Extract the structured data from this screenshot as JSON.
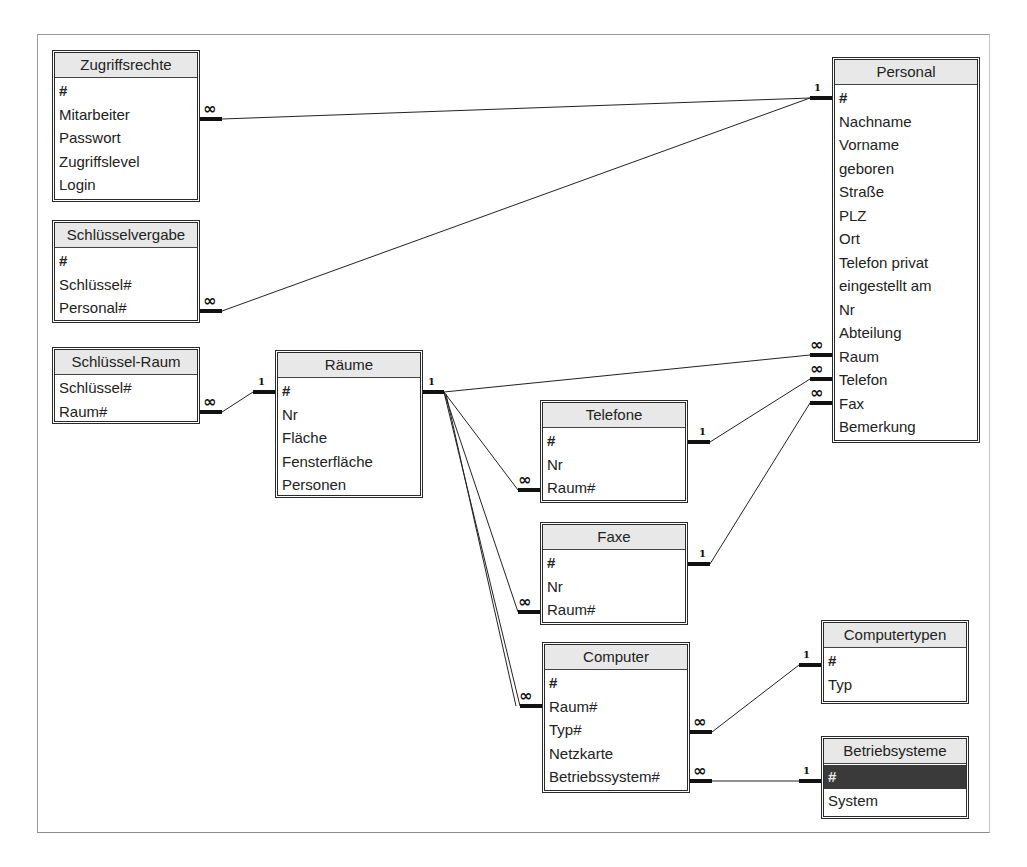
{
  "diagram": {
    "type": "relationships",
    "tables": [
      {
        "id": "zugriffsrechte",
        "name": "Zugriffsrechte",
        "fields": [
          "#",
          "Mitarbeiter",
          "Passwort",
          "Zugriffslevel",
          "Login"
        ]
      },
      {
        "id": "schluesselvergabe",
        "name": "Schlüsselvergabe",
        "fields": [
          "#",
          "Schlüssel#",
          "Personal#"
        ]
      },
      {
        "id": "schluessel_raum",
        "name": "Schlüssel-Raum",
        "fields": [
          "Schlüssel#",
          "Raum#"
        ]
      },
      {
        "id": "raeume",
        "name": "Räume",
        "fields": [
          "#",
          "Nr",
          "Fläche",
          "Fensterfläche",
          "Personen"
        ]
      },
      {
        "id": "personal",
        "name": "Personal",
        "fields": [
          "#",
          "Nachname",
          "Vorname",
          "geboren",
          "Straße",
          "PLZ",
          "Ort",
          "Telefon privat",
          "eingestellt am",
          "Nr",
          "Abteilung",
          "Raum",
          "Telefon",
          "Fax",
          "Bemerkung"
        ]
      },
      {
        "id": "telefone",
        "name": "Telefone",
        "fields": [
          "#",
          "Nr",
          "Raum#"
        ]
      },
      {
        "id": "faxe",
        "name": "Faxe",
        "fields": [
          "#",
          "Nr",
          "Raum#"
        ]
      },
      {
        "id": "computer",
        "name": "Computer",
        "fields": [
          "#",
          "Raum#",
          "Typ#",
          "Netzkarte",
          "Betriebssystem#"
        ]
      },
      {
        "id": "computertypen",
        "name": "Computertypen",
        "fields": [
          "#",
          "Typ"
        ]
      },
      {
        "id": "betriebsysteme",
        "name": "Betriebsysteme",
        "fields": [
          "#",
          "System"
        ],
        "selected_field": "#"
      }
    ],
    "relationships": [
      {
        "from": "Zugriffsrechte.Mitarbeiter",
        "from_card": "∞",
        "to": "Personal.#",
        "to_card": "1"
      },
      {
        "from": "Schlüsselvergabe.Personal#",
        "from_card": "∞",
        "to": "Personal.#",
        "to_card": "1"
      },
      {
        "from": "Schlüssel-Raum.Raum#",
        "from_card": "∞",
        "to": "Räume.#",
        "to_card": "1"
      },
      {
        "from": "Personal.Raum",
        "from_card": "∞",
        "to": "Räume.#",
        "to_card": "1"
      },
      {
        "from": "Telefone.Raum#",
        "from_card": "∞",
        "to": "Räume.#",
        "to_card": "1"
      },
      {
        "from": "Faxe.Raum#",
        "from_card": "∞",
        "to": "Räume.#",
        "to_card": "1"
      },
      {
        "from": "Computer.Raum#",
        "from_card": "∞",
        "to": "Räume.#",
        "to_card": "1"
      },
      {
        "from": "Personal.Telefon",
        "from_card": "∞",
        "to": "Telefone.#",
        "to_card": "1"
      },
      {
        "from": "Personal.Fax",
        "from_card": "∞",
        "to": "Faxe.#",
        "to_card": "1"
      },
      {
        "from": "Computer.Typ#",
        "from_card": "∞",
        "to": "Computertypen.#",
        "to_card": "1"
      },
      {
        "from": "Computer.Betriebssystem#",
        "from_card": "∞",
        "to": "Betriebsysteme.#",
        "to_card": "1"
      }
    ],
    "cardinality_labels": {
      "one": "1",
      "many": "∞"
    }
  }
}
